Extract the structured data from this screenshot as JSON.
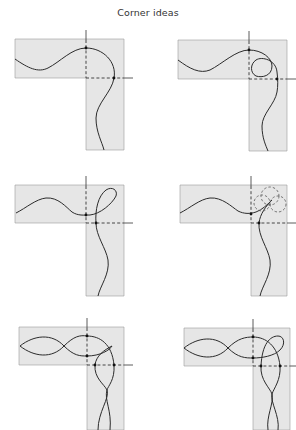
{
  "title": "Corner ideas",
  "panels": [
    {
      "id": "corner-idea-1",
      "description": "single wave turning corner"
    },
    {
      "id": "corner-idea-2",
      "description": "single wave with loop inside corner"
    },
    {
      "id": "corner-idea-3",
      "description": "single wave with outward loop at corner"
    },
    {
      "id": "corner-idea-4",
      "description": "wave with dashed circle overlay at corner"
    },
    {
      "id": "corner-idea-5",
      "description": "double interlaced wave turning corner"
    },
    {
      "id": "corner-idea-6",
      "description": "double interlaced wave with loop at corner"
    }
  ],
  "colors": {
    "band": "#e6e6e6",
    "line": "#2b2b2b",
    "border": "#9a9a9a"
  }
}
